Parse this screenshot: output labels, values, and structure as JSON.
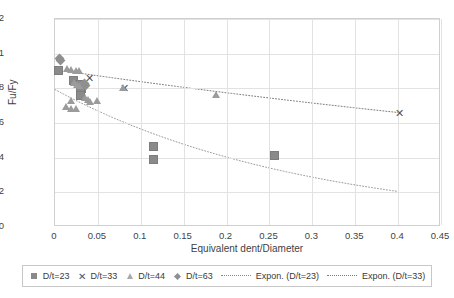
{
  "chart_data": {
    "type": "scatter",
    "title": "",
    "xlabel": "Equivalent dent/Diameter",
    "ylabel": "Fu/Fy",
    "xlim": [
      0,
      0.45
    ],
    "ylim": [
      0,
      1.2
    ],
    "xticks": [
      "0",
      "0.05",
      "0.1",
      "0.15",
      "0.2",
      "0.25",
      "0.3",
      "0.35",
      "0.4",
      "0.45"
    ],
    "xtick_values": [
      0,
      0.05,
      0.1,
      0.15,
      0.2,
      0.25,
      0.3,
      0.35,
      0.4,
      0.45
    ],
    "yticks": [
      "0",
      "0.2",
      "0.4",
      "0.6",
      "0.8",
      "1",
      "1.2"
    ],
    "ytick_values": [
      0,
      0.2,
      0.4,
      0.6,
      0.8,
      1,
      1.2
    ],
    "grid": true,
    "legend_position": "bottom",
    "series": [
      {
        "name": "D/t=23",
        "marker": "square",
        "color": "#8a8a8a",
        "points": [
          [
            0.004,
            0.905
          ],
          [
            0.022,
            0.845
          ],
          [
            0.03,
            0.825
          ],
          [
            0.031,
            0.8
          ],
          [
            0.03,
            0.775
          ],
          [
            0.03,
            0.76
          ],
          [
            0.115,
            0.462
          ],
          [
            0.115,
            0.39
          ],
          [
            0.256,
            0.41
          ]
        ]
      },
      {
        "name": "D/t=33",
        "marker": "x",
        "color": "#555555",
        "points": [
          [
            0.04,
            0.862
          ],
          [
            0.081,
            0.8
          ],
          [
            0.401,
            0.66
          ]
        ]
      },
      {
        "name": "D/t=44",
        "marker": "triangle",
        "color": "#9b9b9b",
        "points": [
          [
            0.014,
            0.912
          ],
          [
            0.019,
            0.905
          ],
          [
            0.024,
            0.9
          ],
          [
            0.028,
            0.898
          ],
          [
            0.022,
            0.832
          ],
          [
            0.026,
            0.822
          ],
          [
            0.029,
            0.815
          ],
          [
            0.019,
            0.727
          ],
          [
            0.013,
            0.69
          ],
          [
            0.019,
            0.678
          ],
          [
            0.024,
            0.678
          ],
          [
            0.035,
            0.742
          ],
          [
            0.038,
            0.735
          ],
          [
            0.041,
            0.722
          ],
          [
            0.049,
            0.728
          ],
          [
            0.079,
            0.803
          ],
          [
            0.188,
            0.762
          ]
        ]
      },
      {
        "name": "D/t=63",
        "marker": "diamond",
        "color": "#8f8f8f",
        "points": [
          [
            0.005,
            0.975
          ],
          [
            0.006,
            0.962
          ],
          [
            0.034,
            0.83
          ],
          [
            0.036,
            0.818
          ]
        ]
      }
    ],
    "trendlines": [
      {
        "name": "Expon. (D/t=23)",
        "style": "dotted",
        "color": "#9a9a9a",
        "from": [
          0.0,
          0.793
        ],
        "to": [
          0.4,
          0.205
        ],
        "curve": "exponential"
      },
      {
        "name": "Expon. (D/t=33)",
        "style": "dotted",
        "color": "#7a7a7a",
        "from": [
          0.004,
          0.905
        ],
        "to": [
          0.401,
          0.66
        ],
        "curve": "exponential"
      }
    ]
  },
  "legend": {
    "items": [
      {
        "label": "D/t=23",
        "key": "square-marker"
      },
      {
        "label": "D/t=33",
        "key": "x-marker"
      },
      {
        "label": "D/t=44",
        "key": "triangle-marker"
      },
      {
        "label": "D/t=63",
        "key": "diamond-marker"
      },
      {
        "label": "Expon. (D/t=23)",
        "key": "dotted-line"
      },
      {
        "label": "Expon. (D/t=33)",
        "key": "dotted-line"
      }
    ]
  }
}
